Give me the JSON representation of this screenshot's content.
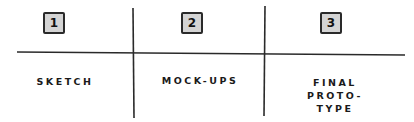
{
  "diagram": {
    "columns": [
      {
        "number": "1",
        "label_lines": [
          "SKETCH"
        ]
      },
      {
        "number": "2",
        "label_lines": [
          "MOCK-UPS"
        ]
      },
      {
        "number": "3",
        "label_lines": [
          "FINAL",
          "PROTO-",
          "TYPE"
        ]
      }
    ],
    "colors": {
      "box_fill": "#d4d4d4",
      "stroke": "#2a2a2a"
    }
  }
}
